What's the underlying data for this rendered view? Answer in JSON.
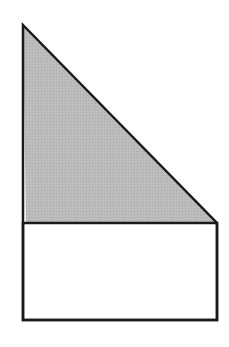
{
  "figure": {
    "colors": {
      "background": "#ffffff",
      "stroke": "#1a1a1a",
      "triangle_fill": "#b9b9b9",
      "rectangle_fill": "#ffffff"
    },
    "shapes": {
      "triangle": {
        "shaded": true,
        "points": [
          [
            23,
            25
          ],
          [
            217,
            223
          ],
          [
            26,
            223
          ]
        ]
      },
      "rectangle": {
        "shaded": false,
        "x": 23,
        "y": 223,
        "width": 194,
        "height": 97
      },
      "outline": {
        "points": [
          [
            23,
            25
          ],
          [
            217,
            223
          ],
          [
            217,
            320
          ],
          [
            23,
            320
          ]
        ]
      }
    }
  }
}
